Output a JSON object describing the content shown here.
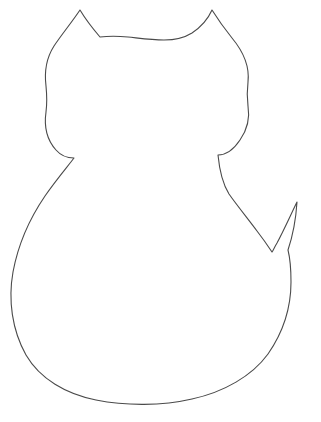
{
  "document": {
    "title": "Cat Silhouette Outline Template",
    "background_color": "#ffffff",
    "width": 321,
    "height": 422
  },
  "artwork": {
    "name": "cat-outline",
    "description": "Line-art outline of a sitting cat seen from behind: two pointed triangular ears, rounded head, narrow neck notches on both sides, large rounded oval body, and a pointed tail rising on the right side.",
    "stroke_color": "#4a4a4a",
    "fill_color": "none",
    "stroke_width": "1.1",
    "parts": [
      {
        "name": "left-ear",
        "tip_x": 80,
        "tip_y": 10
      },
      {
        "name": "right-ear",
        "tip_x": 212,
        "tip_y": 10
      },
      {
        "name": "head-top",
        "y": 36
      },
      {
        "name": "head-left-widest",
        "x": 46,
        "y": 110
      },
      {
        "name": "head-right-widest",
        "x": 248,
        "y": 110
      },
      {
        "name": "neck-notch-left",
        "x": 74,
        "y": 158
      },
      {
        "name": "neck-notch-right",
        "x": 218,
        "y": 155
      },
      {
        "name": "body-left-widest",
        "x": 11,
        "y": 292
      },
      {
        "name": "body-bottom",
        "x": 145,
        "y": 401
      },
      {
        "name": "body-right-widest",
        "x": 293,
        "y": 290
      },
      {
        "name": "tail-tip",
        "x": 297,
        "y": 202
      },
      {
        "name": "tail-valley",
        "x": 272,
        "y": 252
      }
    ],
    "path": "M 80 10 C 72 22 62 34 54 46 C 47 57 44 70 46 86 C 47 96 47 104 46 112 C 44 126 47 140 56 150 C 62 157 68 158 74 158 C 68 166 56 180 45 196 C 30 218 18 245 13 272 C 8 300 12 330 26 355 C 40 379 66 394 96 400 C 126 406 162 406 192 399 C 224 392 252 376 268 354 C 284 331 291 305 291 282 C 291 268 290 258 288 250 C 292 238 296 218 297 202 C 292 212 284 230 277 243 C 274 248 273 251 272 252 C 270 249 264 240 257 231 C 248 219 236 204 229 194 C 224 186 220 176 218 155 C 226 155 234 149 240 140 C 247 130 250 118 248 106 C 247 98 247 90 248 82 C 250 64 242 50 232 38 C 224 28 217 18 212 10 C 208 19 201 27 192 33 C 184 38 174 40 164 40 C 151 40 138 38 128 37 C 118 36 108 36 100 37 C 94 30 86 20 80 10 Z",
    "caption": ""
  }
}
